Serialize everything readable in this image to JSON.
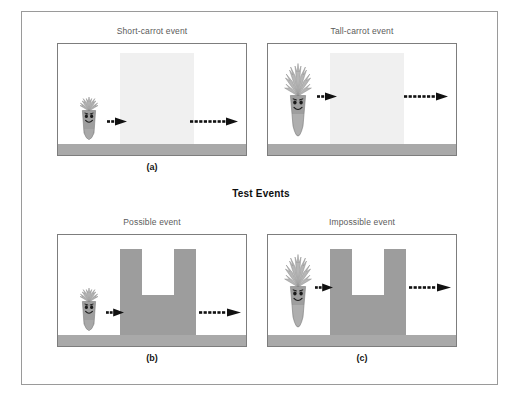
{
  "figure": {
    "sections": [
      {
        "id": "habituation",
        "heading": "",
        "caption": "(a)",
        "events": [
          {
            "id": "short-carrot",
            "title": "Short-carrot event",
            "object": "short-carrot",
            "obstacle": "light-screen",
            "push_arrow": "solid-arrow-right",
            "motion_arrow": "dashed-arrow-right"
          },
          {
            "id": "tall-carrot",
            "title": "Tall-carrot event",
            "object": "tall-carrot",
            "obstacle": "light-screen",
            "push_arrow": "solid-arrow-right",
            "motion_arrow": "dashed-arrow-right"
          }
        ]
      },
      {
        "id": "test",
        "heading": "Test Events",
        "caption_left": "(b)",
        "caption_right": "(c)",
        "events": [
          {
            "id": "possible",
            "title": "Possible event",
            "object": "short-carrot",
            "obstacle": "notched-gray-barrier",
            "push_arrow": "solid-arrow-right",
            "motion_arrow": "dashed-arrow-right"
          },
          {
            "id": "impossible",
            "title": "Impossible event",
            "object": "tall-carrot",
            "obstacle": "notched-gray-barrier",
            "push_arrow": "solid-arrow-right",
            "motion_arrow": "dashed-arrow-right"
          }
        ]
      }
    ],
    "colors": {
      "frame_border": "#9a9a9a",
      "stage_border": "#7d7d7d",
      "floor": "#a9a9a9",
      "screen_occluder": "#f0f0f0",
      "barrier": "#9d9d9d",
      "carrot_body": "#9b9b9b",
      "carrot_leaves": "#b4b4b4",
      "arrow": "#111111",
      "title_text": "#5b5b5b",
      "caption_text": "#141414"
    }
  }
}
